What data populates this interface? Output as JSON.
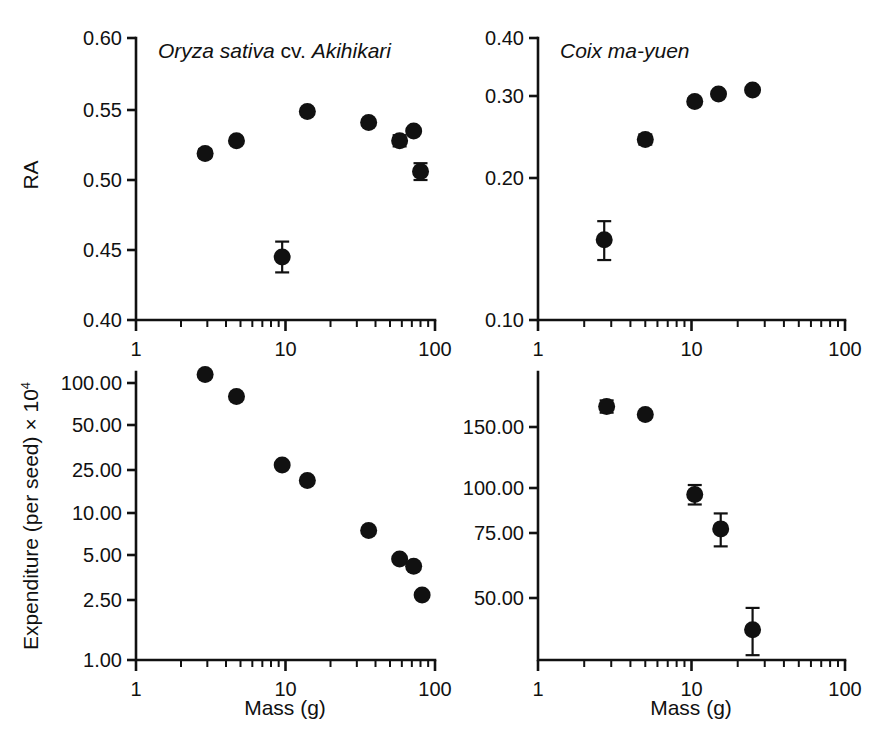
{
  "figure": {
    "width": 888,
    "height": 747,
    "background": "#ffffff",
    "ink": "#111111",
    "marker_color": "#111111"
  },
  "panels": [
    {
      "id": "top-left",
      "title_italic_1": "Oryza sativa",
      "title_upright": " cv. ",
      "title_italic_2": "Akihikari",
      "title_plain": "Oryza sativa cv. Akihikari"
    },
    {
      "id": "top-right",
      "title_italic_1": "Coix ma-yuen",
      "title_upright": "",
      "title_italic_2": "",
      "title_plain": "Coix ma-yuen"
    },
    {
      "id": "bottom-left",
      "title_plain": ""
    },
    {
      "id": "bottom-right",
      "title_plain": ""
    }
  ],
  "labels": {
    "y_ra": "RA",
    "y_expenditure_main": "Expenditure (per seed) × 10",
    "y_expenditure_exponent": "4",
    "x_mass_left": "Mass (g)",
    "x_mass_right": "Mass (g)",
    "x_tick_1": "1",
    "x_tick_10": "10",
    "x_tick_100": "100"
  },
  "chart_data": [
    {
      "type": "scatter",
      "panel": "top-left",
      "title": "Oryza sativa cv. Akihikari",
      "xlabel": "Mass (g)",
      "ylabel": "RA",
      "xscale": "log",
      "yscale": "linear",
      "xlim": [
        1,
        100
      ],
      "ylim": [
        0.4,
        0.6
      ],
      "xticks": [
        1,
        10,
        100
      ],
      "xticklabels": [
        "1",
        "10",
        "100"
      ],
      "yticks": [
        0.4,
        0.45,
        0.5,
        0.55,
        0.6
      ],
      "yticklabels": [
        "0.40",
        "0.45",
        "0.50",
        "0.55",
        "0.60"
      ],
      "grid": false,
      "legend": "none",
      "x": [
        2.9,
        4.7,
        9.5,
        14.0,
        36.0,
        58.0,
        72.0,
        80.0
      ],
      "y": [
        0.519,
        0.528,
        0.445,
        0.549,
        0.541,
        0.528,
        0.535,
        0.506
      ],
      "yerr": [
        0.003,
        0.002,
        0.011,
        0.002,
        0.002,
        0.004,
        0.002,
        0.006
      ]
    },
    {
      "type": "scatter",
      "panel": "top-right",
      "title": "Coix ma-yuen",
      "xlabel": "Mass (g)",
      "ylabel": "RA",
      "xscale": "log",
      "yscale": "log",
      "xlim": [
        1,
        100
      ],
      "ylim": [
        0.1,
        0.4
      ],
      "xticks": [
        1,
        10,
        100
      ],
      "xticklabels": [
        "1",
        "10",
        "100"
      ],
      "yticks": [
        0.1,
        0.2,
        0.3,
        0.4
      ],
      "yticklabels": [
        "0.10",
        "0.20",
        "0.30",
        "0.40"
      ],
      "grid": false,
      "legend": "none",
      "x": [
        2.7,
        5.0,
        10.5,
        15.0,
        25.0
      ],
      "y": [
        0.148,
        0.242,
        0.292,
        0.303,
        0.309
      ],
      "yerr": [
        0.014,
        0.006,
        0.005,
        0.003,
        0.003
      ]
    },
    {
      "type": "scatter",
      "panel": "bottom-left",
      "title": "",
      "xlabel": "Mass (g)",
      "ylabel": "Expenditure (per seed) × 10^4",
      "xscale": "log",
      "yscale": "log",
      "xlim": [
        1,
        100
      ],
      "ylim": [
        1.0,
        130.0
      ],
      "xticks": [
        1,
        10,
        100
      ],
      "xticklabels": [
        "1",
        "10",
        "100"
      ],
      "yticks": [
        1.0,
        2.5,
        5.0,
        10.0,
        25.0,
        50.0,
        100.0
      ],
      "yticklabels": [
        "1.00",
        "2.50",
        "5.00",
        "10.00",
        "25.00",
        "50.00",
        "100.00"
      ],
      "grid": false,
      "legend": "none",
      "x": [
        2.9,
        4.7,
        9.5,
        14.0,
        36.0,
        58.0,
        72.0,
        82.0
      ],
      "y": [
        115.0,
        80.0,
        27.0,
        20.0,
        7.5,
        4.7,
        4.2,
        2.7
      ],
      "yerr": [
        0.0,
        0.0,
        0.0,
        0.0,
        0.0,
        0.0,
        0.0,
        0.0
      ]
    },
    {
      "type": "scatter",
      "panel": "bottom-right",
      "title": "",
      "xlabel": "Mass (g)",
      "ylabel": "Expenditure (per seed) × 10^4",
      "xscale": "log",
      "yscale": "log",
      "xlim": [
        1,
        100
      ],
      "ylim": [
        30.0,
        230.0
      ],
      "xticks": [
        1,
        10,
        100
      ],
      "xticklabels": [
        "1",
        "10",
        "100"
      ],
      "yticks": [
        50.0,
        75.0,
        100.0,
        150.0
      ],
      "yticklabels": [
        "50.00",
        "75.00",
        "100.00",
        "150.00"
      ],
      "grid": false,
      "legend": "none",
      "x": [
        2.8,
        5.0,
        10.5,
        15.5,
        25.0
      ],
      "y": [
        172.0,
        163.0,
        96.0,
        77.0,
        41.0
      ],
      "yerr": [
        7.0,
        3.0,
        6.0,
        8.0,
        6.0
      ]
    }
  ],
  "caption_fragment": ""
}
